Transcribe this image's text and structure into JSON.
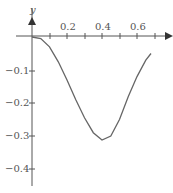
{
  "chart_data": {
    "type": "line",
    "title": "",
    "xlabel": "",
    "ylabel": "y",
    "x_ticks": [
      0.1,
      0.2,
      0.3,
      0.4,
      0.5,
      0.6,
      0.7
    ],
    "x_tick_labels": [
      "0.2",
      "0.4",
      "0.6"
    ],
    "y_tick_labels": [
      "-0.1",
      "-0.2",
      "-0.3",
      "-0.4"
    ],
    "xlim": [
      0,
      0.72
    ],
    "ylim": [
      -0.45,
      0.04
    ],
    "grid": false,
    "series": [
      {
        "name": "curve",
        "x": [
          0,
          0.05,
          0.1,
          0.15,
          0.2,
          0.25,
          0.3,
          0.35,
          0.4,
          0.45,
          0.5,
          0.55,
          0.6,
          0.65,
          0.68
        ],
        "y": [
          0,
          -0.005,
          -0.03,
          -0.075,
          -0.13,
          -0.19,
          -0.245,
          -0.29,
          -0.312,
          -0.3,
          -0.25,
          -0.18,
          -0.12,
          -0.07,
          -0.05
        ]
      }
    ],
    "colors": {
      "axis": "#555555",
      "line": "#666666"
    }
  }
}
